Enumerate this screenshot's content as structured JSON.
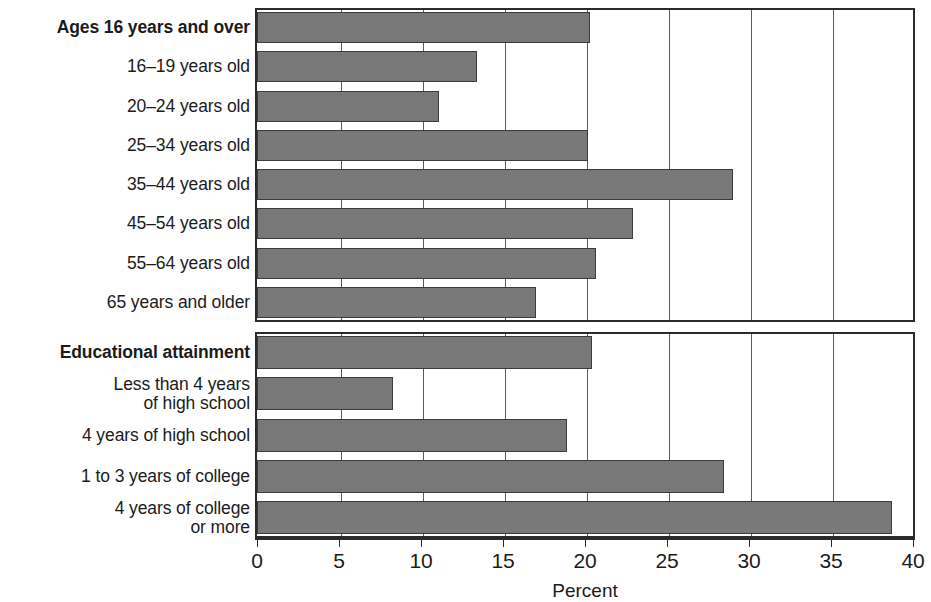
{
  "chart_data": {
    "type": "bar",
    "orientation": "horizontal",
    "title": "",
    "xlabel": "Percent",
    "ylabel": "",
    "xlim": [
      0,
      40
    ],
    "xticks": [
      "0",
      "5",
      "10",
      "15",
      "20",
      "25",
      "30",
      "35",
      "40"
    ],
    "xtick_values": [
      0,
      5,
      10,
      15,
      20,
      25,
      30,
      35,
      40
    ],
    "grid": "vertical",
    "legend": "none",
    "bar_color": "#787878",
    "panels": [
      {
        "name": "age",
        "categories": [
          "Ages 16 years and over",
          "16–19 years old",
          "20–24 years old",
          "25–34 years old",
          "35–44 years old",
          "45–54 years old",
          "55–64 years old",
          "65 years and older"
        ],
        "bold_categories": [
          true,
          false,
          false,
          false,
          false,
          false,
          false,
          false
        ],
        "values": [
          20.3,
          13.4,
          11.1,
          20.2,
          29.0,
          22.9,
          20.7,
          17.0
        ]
      },
      {
        "name": "education",
        "categories": [
          "Educational attainment",
          "Less than 4 years\nof high school",
          "4 years of high school",
          "1 to 3 years of college",
          "4 years of college\nor more"
        ],
        "bold_categories": [
          true,
          false,
          false,
          false,
          false
        ],
        "values": [
          20.4,
          8.3,
          18.9,
          28.5,
          38.7
        ]
      }
    ]
  }
}
